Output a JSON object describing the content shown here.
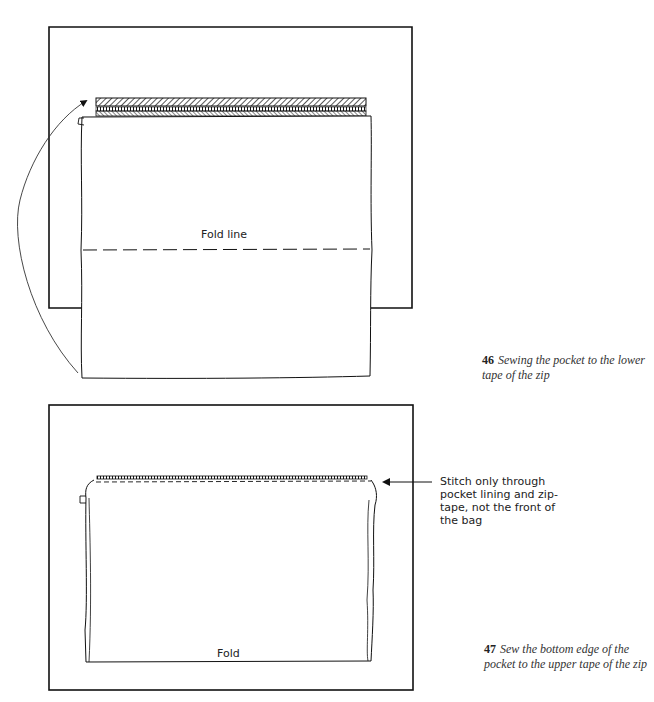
{
  "figures": [
    {
      "number": "46",
      "caption": "Sewing the pocket to the lower tape of the zip",
      "labels": {
        "fold_line": "Fold line"
      }
    },
    {
      "number": "47",
      "caption": "Sew the bottom edge of the pocket to the upper tape of the zip",
      "labels": {
        "fold": "Fold",
        "stitch_note": "Stitch only through pocket lining and zip-tape, not the front of the bag"
      }
    }
  ],
  "colors": {
    "ink": "#111111",
    "paper": "#ffffff",
    "caption": "#333333"
  }
}
